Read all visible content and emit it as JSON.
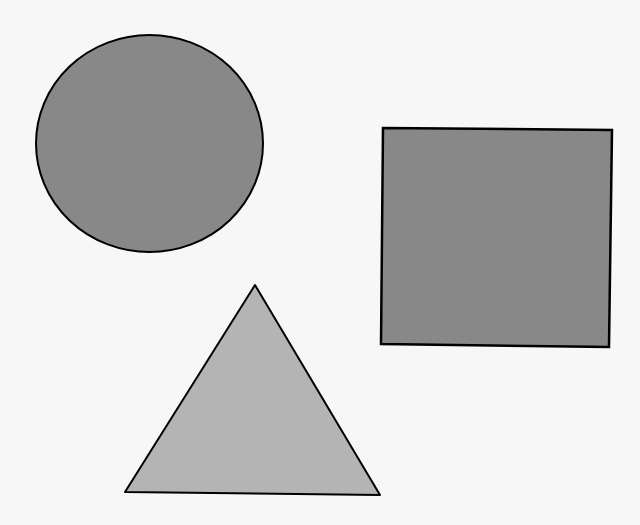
{
  "canvas": {
    "width": 640,
    "height": 525,
    "background": "#f7f7f7"
  },
  "shapes": [
    {
      "type": "circle",
      "cx": 149.5,
      "cy": 143.5,
      "rx": 113.5,
      "ry": 108.5,
      "fill": "#888888",
      "stroke": "#000000",
      "stroke_width": 2
    },
    {
      "type": "square",
      "points": "383,128 612,130 609,347 381,344",
      "fill": "#888888",
      "stroke": "#000000",
      "stroke_width": 2.5
    },
    {
      "type": "triangle",
      "points": "255,285 380,495 125,492",
      "fill": "#b4b4b4",
      "stroke": "#000000",
      "stroke_width": 2
    }
  ]
}
